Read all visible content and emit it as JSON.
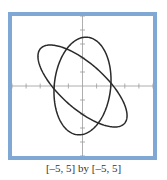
{
  "chart_data": {
    "type": "line",
    "title": "",
    "xlabel": "",
    "ylabel": "",
    "xlim": [
      -5,
      5
    ],
    "ylim": [
      -5,
      5
    ],
    "xticks": [
      -5,
      -4,
      -3,
      -2,
      -1,
      1,
      2,
      3,
      4,
      5
    ],
    "yticks": [
      -5,
      -4,
      -3,
      -2,
      -1,
      1,
      2,
      3,
      4,
      5
    ],
    "grid": false,
    "legend": "none",
    "series": [
      {
        "name": "curve-1",
        "kind": "ellipse",
        "center": [
          0,
          0
        ],
        "semi_axis_x": 2.0,
        "semi_axis_y": 3.5,
        "rotation_deg": -6
      },
      {
        "name": "curve-2",
        "kind": "ellipse",
        "center": [
          0,
          0
        ],
        "semi_major": 4.0,
        "semi_minor": 1.6,
        "rotation_deg": -42
      }
    ],
    "caption": "[–5, 5] by [–5, 5]"
  },
  "colors": {
    "frame": "#7fa8d4",
    "axis": "#9a9a9a",
    "curve": "#2a2a2a"
  }
}
